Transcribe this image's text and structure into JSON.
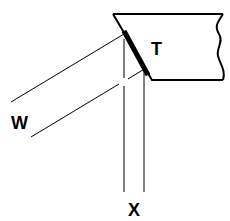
{
  "diagram": {
    "labels": {
      "target": "T",
      "incident": "W",
      "output": "X"
    },
    "colors": {
      "stroke": "#000000",
      "background": "#ffffff"
    }
  }
}
